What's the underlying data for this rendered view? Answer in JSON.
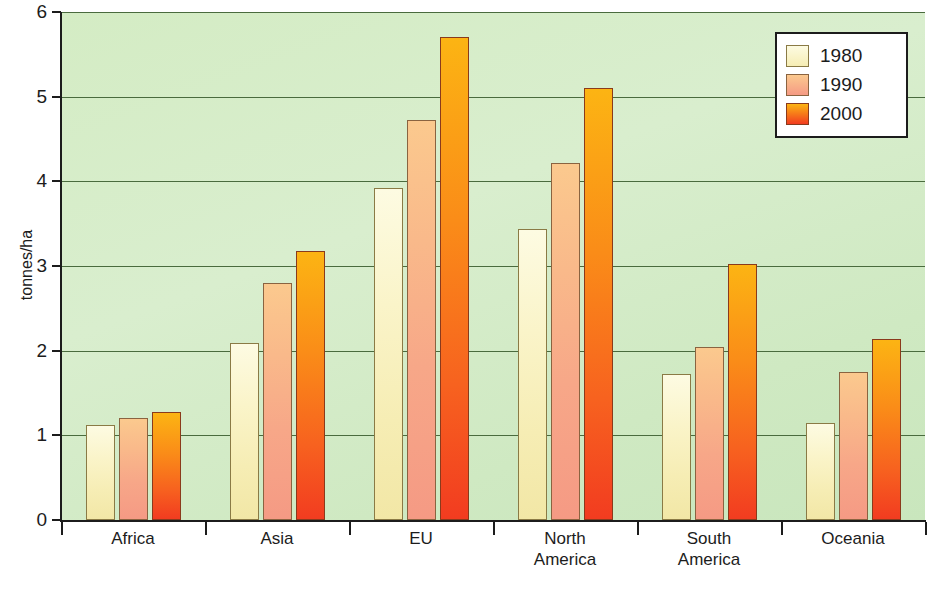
{
  "chart_data": {
    "type": "bar",
    "title": "",
    "xlabel": "",
    "ylabel": "tonnes/ha",
    "ylim": [
      0,
      6
    ],
    "yticks": [
      0,
      1,
      2,
      3,
      4,
      5,
      6
    ],
    "ytick_labels": [
      "0",
      "1",
      "2",
      "3",
      "4",
      "5",
      "6"
    ],
    "grid": true,
    "grid_axis": "y",
    "legend_position": "top-right",
    "categories": [
      "Africa",
      "Asia",
      "EU",
      "North\nAmerica",
      "South\nAmerica",
      "Oceania"
    ],
    "series": [
      {
        "name": "1980",
        "color": "#f6edb4",
        "values": [
          1.12,
          2.09,
          3.92,
          3.44,
          1.72,
          1.14
        ]
      },
      {
        "name": "1990",
        "color": "#f7a788",
        "values": [
          1.2,
          2.8,
          4.73,
          4.22,
          2.04,
          1.75
        ]
      },
      {
        "name": "2000",
        "color": "#f7621f",
        "values": [
          1.27,
          3.18,
          5.7,
          5.1,
          3.02,
          2.14
        ]
      }
    ],
    "plot_background_color": "#d4ecc4",
    "gridline_color": "#4a6b3e",
    "axis_color": "#1c1c1c"
  },
  "legend": {
    "entries": [
      {
        "label": "1980"
      },
      {
        "label": "1990"
      },
      {
        "label": "2000"
      }
    ]
  }
}
